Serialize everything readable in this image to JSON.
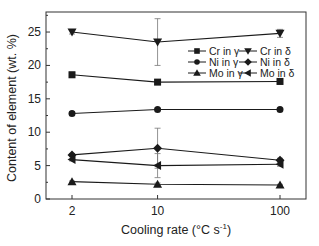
{
  "chart_data": {
    "type": "line",
    "title": "",
    "xlabel": "Cooling rate (°C s⁻¹)",
    "xlabel_parts": {
      "main": "Cooling rate (°C s",
      "sup": "-1",
      "close": ")"
    },
    "ylabel": "Content of element (wt. %)",
    "x": [
      2,
      10,
      100
    ],
    "x_tick_labels": [
      "2",
      "10",
      "100"
    ],
    "x_scale": "log",
    "y_ticks": [
      0,
      5,
      10,
      15,
      20,
      25
    ],
    "y_tick_labels": [
      "0",
      "5",
      "10",
      "15",
      "20",
      "25"
    ],
    "ylim": [
      0,
      28
    ],
    "grid": false,
    "legend_position": "upper right, inside",
    "series": [
      {
        "name": "Cr in γ",
        "marker": "square",
        "values": [
          18.6,
          17.5,
          17.6
        ],
        "errors": [
          0.4,
          0.3,
          0.3
        ]
      },
      {
        "name": "Cr in δ",
        "marker": "triangle-down",
        "values": [
          25.0,
          23.5,
          24.8
        ],
        "errors": [
          0.3,
          3.5,
          0.6
        ]
      },
      {
        "name": "Ni in γ",
        "marker": "circle",
        "values": [
          12.8,
          13.4,
          13.4
        ],
        "errors": [
          0.3,
          0.2,
          0.2
        ]
      },
      {
        "name": "Ni in δ",
        "marker": "diamond",
        "values": [
          6.6,
          7.6,
          5.8
        ],
        "errors": [
          0.2,
          3.0,
          0.3
        ]
      },
      {
        "name": "Mo in γ",
        "marker": "triangle-up",
        "values": [
          2.6,
          2.2,
          2.1
        ],
        "errors": [
          0.1,
          0.2,
          0.1
        ]
      },
      {
        "name": "Mo in δ",
        "marker": "triangle-left",
        "values": [
          5.9,
          5.0,
          5.2
        ],
        "errors": [
          0.2,
          1.8,
          0.3
        ]
      }
    ],
    "legend": [
      [
        "Cr in γ",
        "Cr in δ"
      ],
      [
        "Ni in γ",
        "Ni in δ"
      ],
      [
        "Mo in γ",
        "Mo in δ"
      ]
    ]
  },
  "colors": {
    "line": "#1a1a1a",
    "axis": "#333333",
    "errorbar": "#777777",
    "background": "#ffffff"
  }
}
